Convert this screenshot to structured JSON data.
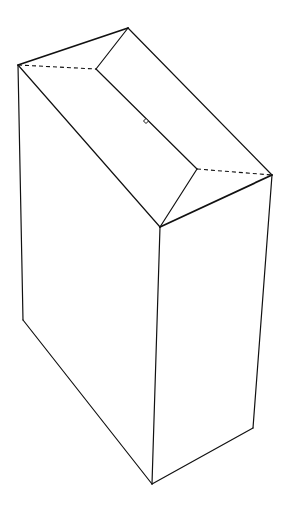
{
  "diagram": {
    "stroke_color": "#111111",
    "background": "#ffffff",
    "points": {
      "top_left": [
        18,
        65
      ],
      "top_peak": [
        128,
        28
      ],
      "right_corner": [
        272,
        175
      ],
      "front_top": [
        160,
        227
      ],
      "inner_left": [
        96,
        69
      ],
      "inner_right": [
        197,
        169
      ],
      "left_bottom": [
        23,
        320
      ],
      "bottom": [
        152,
        484
      ],
      "right_bottom": [
        253,
        428
      ],
      "slot_marker": [
        146,
        121
      ]
    },
    "edges": {
      "solid": [
        [
          "top_left",
          "top_peak"
        ],
        [
          "top_peak",
          "right_corner"
        ],
        [
          "top_left",
          "front_top"
        ],
        [
          "front_top",
          "right_corner"
        ],
        [
          "top_peak",
          "inner_left"
        ],
        [
          "inner_left",
          "inner_right"
        ],
        [
          "inner_right",
          "front_top"
        ],
        [
          "top_left",
          "left_bottom"
        ],
        [
          "left_bottom",
          "bottom"
        ],
        [
          "front_top",
          "bottom"
        ],
        [
          "right_corner",
          "right_bottom"
        ],
        [
          "right_bottom",
          "bottom"
        ]
      ],
      "dashed": [
        [
          "top_left",
          "inner_left"
        ],
        [
          "inner_right",
          "right_corner"
        ]
      ]
    }
  }
}
